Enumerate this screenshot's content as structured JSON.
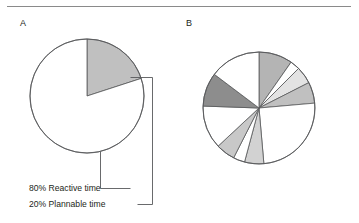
{
  "figure": {
    "panels": [
      {
        "letter": "A",
        "name": "panel-a"
      },
      {
        "letter": "B",
        "name": "panel-b"
      }
    ],
    "callouts": [
      {
        "id": "reactive",
        "text": "80% Reactive time"
      },
      {
        "id": "plannable",
        "text": "20% Plannable time"
      }
    ]
  },
  "colors": {
    "stroke": "#58595b",
    "rule": "#8a8a8a",
    "text": "#231f20",
    "white": "#ffffff",
    "gray_light": "#e3e3e3",
    "gray_mid_light": "#d2d2d2",
    "gray_mid": "#c0c0c0",
    "gray_med": "#b4b4b4",
    "gray_dark": "#8d8d8d"
  },
  "chart_data": [
    {
      "type": "pie",
      "name": "panel-a-pie",
      "title": "A",
      "center": [
        87,
        96
      ],
      "radius": 57,
      "start_angle_deg": 0,
      "direction": "clockwise",
      "labels": [
        "20% Plannable time",
        "80% Reactive time"
      ],
      "values": [
        20,
        80
      ],
      "units": "percent",
      "colors": [
        "#c0c0c0",
        "#ffffff"
      ],
      "legend": "leader-lines",
      "grid": false
    },
    {
      "type": "pie",
      "name": "panel-b-pie",
      "title": "B",
      "center": [
        259,
        108
      ],
      "radius": 56,
      "start_angle_deg": 0,
      "direction": "clockwise",
      "labels": [
        "segment-1",
        "segment-2",
        "segment-3",
        "segment-4",
        "segment-5",
        "segment-6",
        "segment-7",
        "segment-8",
        "segment-9",
        "segment-10",
        "segment-11"
      ],
      "values": [
        9.7,
        2.8,
        5.0,
        6.1,
        25.0,
        5.6,
        3.3,
        5.6,
        12.5,
        9.7,
        14.7
      ],
      "units": "percent",
      "angles_deg": [
        35,
        10,
        18,
        22,
        90,
        20,
        12,
        20,
        45,
        35,
        53
      ],
      "colors": [
        "#b4b4b4",
        "#ffffff",
        "#e3e3e3",
        "#c0c0c0",
        "#ffffff",
        "#d2d2d2",
        "#ffffff",
        "#c8c8c8",
        "#ffffff",
        "#8d8d8d",
        "#ffffff"
      ],
      "legend": "none",
      "grid": false
    }
  ]
}
